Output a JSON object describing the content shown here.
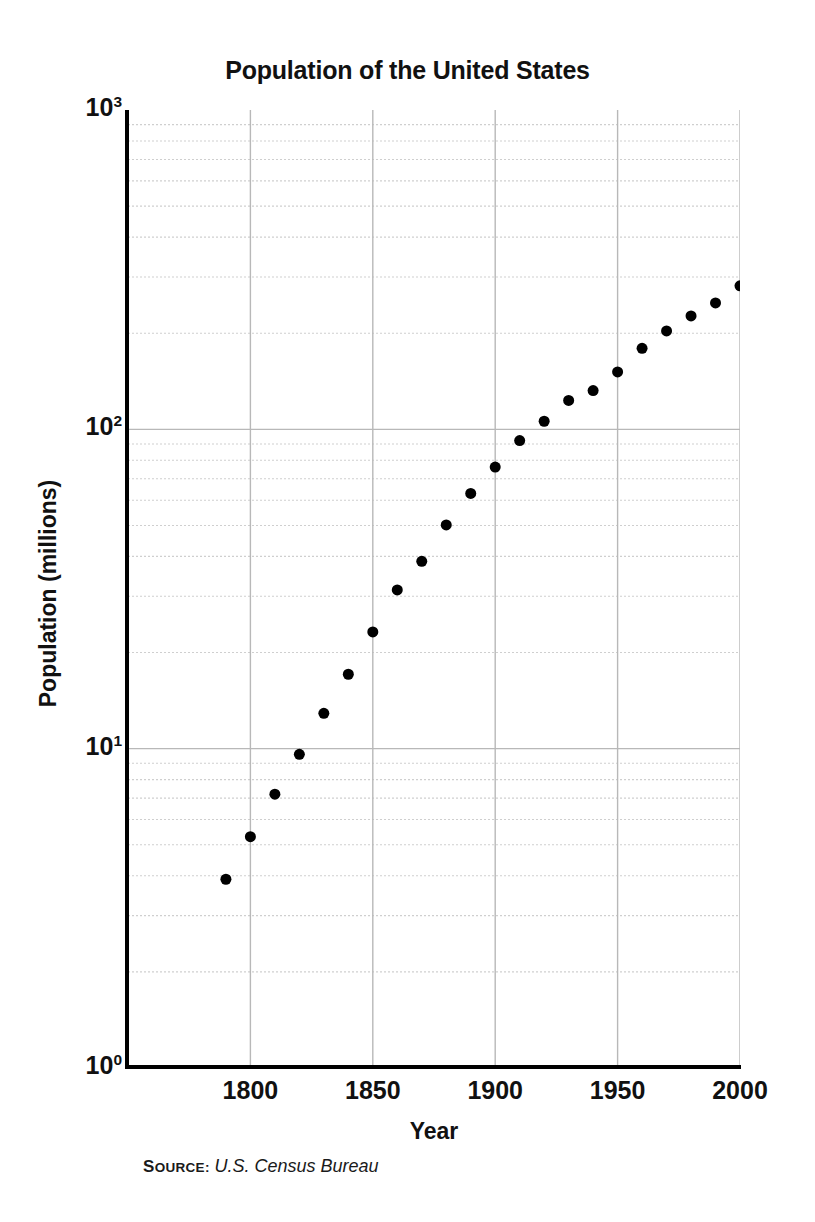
{
  "chart_data": {
    "type": "scatter",
    "title": "Population of the United States",
    "xlabel": "Year",
    "ylabel": "Population (millions)",
    "yscale": "log",
    "xlim": [
      1750,
      2000
    ],
    "ylim": [
      1,
      1000
    ],
    "grid": true,
    "legend": null,
    "marker": {
      "shape": "circle",
      "color": "#000000",
      "size": 11
    },
    "x_ticks": [
      "1800",
      "1850",
      "1900",
      "1950",
      "2000"
    ],
    "x_tick_values": [
      1800,
      1850,
      1900,
      1950,
      2000
    ],
    "y_ticks": [
      "10^0",
      "10^1",
      "10^2",
      "10^3"
    ],
    "y_tick_values": [
      1,
      10,
      100,
      1000
    ],
    "x": [
      1790,
      1800,
      1810,
      1820,
      1830,
      1840,
      1850,
      1860,
      1870,
      1880,
      1890,
      1900,
      1910,
      1920,
      1930,
      1940,
      1950,
      1960,
      1970,
      1980,
      1990,
      2000
    ],
    "values": [
      3.9,
      5.3,
      7.2,
      9.6,
      12.9,
      17.1,
      23.2,
      31.4,
      38.6,
      50.2,
      63.0,
      76.2,
      92.2,
      106.0,
      123.2,
      132.2,
      151.3,
      179.3,
      203.3,
      226.5,
      248.7,
      281.4
    ],
    "series": [
      {
        "name": "U.S. population",
        "points": [
          {
            "year": 1790,
            "population": 3.9
          },
          {
            "year": 1800,
            "population": 5.3
          },
          {
            "year": 1810,
            "population": 7.2
          },
          {
            "year": 1820,
            "population": 9.6
          },
          {
            "year": 1830,
            "population": 12.9
          },
          {
            "year": 1840,
            "population": 17.1
          },
          {
            "year": 1850,
            "population": 23.2
          },
          {
            "year": 1860,
            "population": 31.4
          },
          {
            "year": 1870,
            "population": 38.6
          },
          {
            "year": 1880,
            "population": 50.2
          },
          {
            "year": 1890,
            "population": 63.0
          },
          {
            "year": 1900,
            "population": 76.2
          },
          {
            "year": 1910,
            "population": 92.2
          },
          {
            "year": 1920,
            "population": 106.0
          },
          {
            "year": 1930,
            "population": 123.2
          },
          {
            "year": 1940,
            "population": 132.2
          },
          {
            "year": 1950,
            "population": 151.3
          },
          {
            "year": 1960,
            "population": 179.3
          },
          {
            "year": 1970,
            "population": 203.3
          },
          {
            "year": 1980,
            "population": 226.5
          },
          {
            "year": 1990,
            "population": 248.7
          },
          {
            "year": 2000,
            "population": 281.4
          }
        ]
      }
    ]
  },
  "axes": {
    "y_tick_labels": [
      {
        "mantissa": "10",
        "exponent": "3",
        "value": 1000
      },
      {
        "mantissa": "10",
        "exponent": "2",
        "value": 100
      },
      {
        "mantissa": "10",
        "exponent": "1",
        "value": 10
      },
      {
        "mantissa": "10",
        "exponent": "0",
        "value": 1
      }
    ],
    "x_tick_labels": [
      "1800",
      "1850",
      "1900",
      "1950",
      "2000"
    ],
    "x_title": "Year",
    "y_title": "Population (millions)"
  },
  "title": "Population of the United States",
  "source": {
    "label": "Source:",
    "label_first_letter": "S",
    "label_rest": "OURCE:",
    "value": "U.S. Census Bureau"
  },
  "colors": {
    "marker": "#000000",
    "axis": "#000000",
    "major_grid": "#b8b8b8",
    "minor_grid": "#cfcfcf",
    "text": "#111111",
    "background": "#ffffff"
  }
}
